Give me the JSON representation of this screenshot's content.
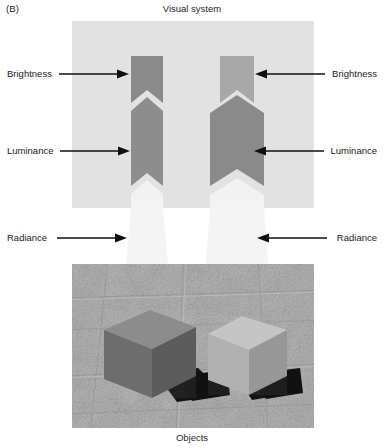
{
  "figure": {
    "panel_label": "(B)",
    "top_title": "Visual system",
    "bottom_title": "Objects"
  },
  "annotations": {
    "brightness": {
      "left_label": "Brightness",
      "right_label": "Brightness",
      "left_arrow_icon": "arrow-right-icon",
      "right_arrow_icon": "arrow-left-icon"
    },
    "luminance": {
      "left_label": "Luminance",
      "right_label": "Luminance",
      "left_arrow_icon": "arrow-right-icon",
      "right_arrow_icon": "arrow-left-icon"
    },
    "radiance": {
      "left_label": "Radiance",
      "right_label": "Radiance",
      "left_arrow_icon": "arrow-right-icon",
      "right_arrow_icon": "arrow-left-icon"
    }
  },
  "colors": {
    "panel_background": "#e2e2e2",
    "brightness_left_fill": "#8a8a8a",
    "brightness_right_fill": "#a8a8a8",
    "luminance_left_fill": "#8d8d8d",
    "luminance_right_fill": "#8a8a8a",
    "radiance_fill": "#f2f2f2",
    "cube_left_top": "#8f8f8f",
    "cube_left_front": "#6f6f6f",
    "cube_left_side": "#5d5d5d",
    "cube_right_top": "#c8c8c8",
    "cube_right_front": "#b4b4b4",
    "cube_right_side": "#9a9a9a",
    "shadow_fill": "#141414",
    "ground_fill": "#a8a8a8",
    "text_color": "#1a1a1a"
  },
  "scene": {
    "description": "Two cubes on a textured concrete ground with cast shadows",
    "objects": [
      {
        "name": "left-cube",
        "appearance": "dark grey cube"
      },
      {
        "name": "right-cube",
        "appearance": "light grey cube"
      }
    ]
  }
}
